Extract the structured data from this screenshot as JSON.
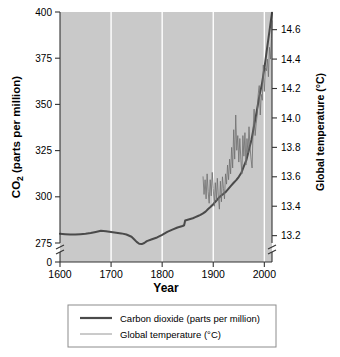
{
  "chart_data": {
    "type": "line",
    "title": "",
    "xlabel": "Year",
    "ylabel": "CO2 (parts per million)",
    "ylabel_right": "Global temperature (°C)",
    "xlim": [
      1600,
      2015
    ],
    "ylim": [
      275,
      400
    ],
    "ylim_right": [
      13.15,
      14.72
    ],
    "xticks": [
      1600,
      1700,
      1800,
      1900,
      2000
    ],
    "xticklabels": [
      "1600",
      "1700",
      "1800",
      "1900",
      "2000"
    ],
    "yticks": [
      275,
      300,
      325,
      350,
      375,
      400
    ],
    "yticklabels": [
      "275",
      "300",
      "325",
      "350",
      "375",
      "400"
    ],
    "y_broken_tick": "0",
    "yticks_right": [
      13.2,
      13.4,
      13.6,
      13.8,
      14.0,
      14.2,
      14.4,
      14.6
    ],
    "yticklabels_right": [
      "13.2",
      "13.4",
      "13.6",
      "13.8",
      "14.0",
      "14.2",
      "14.4",
      "14.6"
    ],
    "grid": "vertical-white",
    "axis_break_left": true,
    "axis_break_right": true,
    "legend_position": "below",
    "plot_background": "#c9c9c9",
    "series": [
      {
        "name": "Carbon dioxide (parts per million)",
        "axis": "left",
        "color": "#4a4a4a",
        "width": 2.0,
        "points": [
          [
            1600,
            280.0
          ],
          [
            1610,
            279.8
          ],
          [
            1620,
            279.6
          ],
          [
            1630,
            279.6
          ],
          [
            1640,
            279.8
          ],
          [
            1650,
            280.0
          ],
          [
            1660,
            280.4
          ],
          [
            1670,
            281.0
          ],
          [
            1680,
            281.6
          ],
          [
            1690,
            281.4
          ],
          [
            1700,
            281.0
          ],
          [
            1710,
            280.6
          ],
          [
            1720,
            280.2
          ],
          [
            1730,
            279.6
          ],
          [
            1740,
            278.4
          ],
          [
            1745,
            277.0
          ],
          [
            1750,
            275.6
          ],
          [
            1755,
            274.6
          ],
          [
            1760,
            274.4
          ],
          [
            1765,
            275.0
          ],
          [
            1770,
            276.0
          ],
          [
            1780,
            277.0
          ],
          [
            1790,
            278.0
          ],
          [
            1800,
            279.4
          ],
          [
            1810,
            281.0
          ],
          [
            1820,
            282.2
          ],
          [
            1830,
            283.4
          ],
          [
            1840,
            284.2
          ],
          [
            1843,
            284.6
          ],
          [
            1845,
            287.2
          ],
          [
            1850,
            287.6
          ],
          [
            1855,
            288.0
          ],
          [
            1860,
            288.4
          ],
          [
            1865,
            289.0
          ],
          [
            1870,
            289.6
          ],
          [
            1875,
            290.2
          ],
          [
            1880,
            291.0
          ],
          [
            1885,
            292.0
          ],
          [
            1890,
            293.4
          ],
          [
            1895,
            294.6
          ],
          [
            1900,
            296.0
          ],
          [
            1905,
            297.6
          ],
          [
            1910,
            299.2
          ],
          [
            1915,
            300.6
          ],
          [
            1920,
            301.6
          ],
          [
            1925,
            302.8
          ],
          [
            1930,
            304.4
          ],
          [
            1935,
            306.0
          ],
          [
            1940,
            307.6
          ],
          [
            1945,
            309.0
          ],
          [
            1950,
            310.8
          ],
          [
            1955,
            313.0
          ],
          [
            1960,
            316.6
          ],
          [
            1965,
            320.0
          ],
          [
            1970,
            325.6
          ],
          [
            1975,
            331.0
          ],
          [
            1980,
            338.6
          ],
          [
            1985,
            346.0
          ],
          [
            1990,
            354.2
          ],
          [
            1995,
            360.6
          ],
          [
            2000,
            369.4
          ],
          [
            2005,
            379.6
          ],
          [
            2010,
            389.6
          ],
          [
            2015,
            399.6
          ]
        ]
      },
      {
        "name": "Global temperature (°C)",
        "axis": "right",
        "color": "#6e6e6e",
        "width": 0.8,
        "points": [
          [
            1880,
            13.6
          ],
          [
            1882,
            13.48
          ],
          [
            1884,
            13.58
          ],
          [
            1886,
            13.45
          ],
          [
            1888,
            13.62
          ],
          [
            1890,
            13.5
          ],
          [
            1892,
            13.42
          ],
          [
            1894,
            13.58
          ],
          [
            1896,
            13.47
          ],
          [
            1898,
            13.63
          ],
          [
            1900,
            13.52
          ],
          [
            1902,
            13.4
          ],
          [
            1904,
            13.56
          ],
          [
            1906,
            13.44
          ],
          [
            1908,
            13.59
          ],
          [
            1910,
            13.46
          ],
          [
            1912,
            13.38
          ],
          [
            1914,
            13.57
          ],
          [
            1916,
            13.43
          ],
          [
            1918,
            13.6
          ],
          [
            1920,
            13.52
          ],
          [
            1922,
            13.45
          ],
          [
            1924,
            13.62
          ],
          [
            1926,
            13.55
          ],
          [
            1928,
            13.68
          ],
          [
            1930,
            13.58
          ],
          [
            1932,
            13.72
          ],
          [
            1934,
            13.62
          ],
          [
            1936,
            13.8
          ],
          [
            1938,
            13.66
          ],
          [
            1940,
            13.92
          ],
          [
            1942,
            13.72
          ],
          [
            1944,
            14.02
          ],
          [
            1946,
            13.78
          ],
          [
            1948,
            13.88
          ],
          [
            1950,
            13.7
          ],
          [
            1952,
            13.86
          ],
          [
            1954,
            13.72
          ],
          [
            1956,
            13.62
          ],
          [
            1958,
            13.88
          ],
          [
            1960,
            13.74
          ],
          [
            1962,
            13.9
          ],
          [
            1964,
            13.68
          ],
          [
            1966,
            13.86
          ],
          [
            1968,
            13.76
          ],
          [
            1970,
            13.94
          ],
          [
            1972,
            13.8
          ],
          [
            1974,
            13.72
          ],
          [
            1976,
            13.66
          ],
          [
            1978,
            13.92
          ],
          [
            1980,
            14.06
          ],
          [
            1982,
            13.88
          ],
          [
            1984,
            13.96
          ],
          [
            1986,
            14.02
          ],
          [
            1988,
            14.16
          ],
          [
            1990,
            14.22
          ],
          [
            1992,
            14.02
          ],
          [
            1994,
            14.16
          ],
          [
            1996,
            14.12
          ],
          [
            1998,
            14.36
          ],
          [
            2000,
            14.18
          ],
          [
            2002,
            14.34
          ],
          [
            2004,
            14.32
          ],
          [
            2006,
            14.4
          ],
          [
            2008,
            14.28
          ],
          [
            2010,
            14.48
          ],
          [
            2012,
            14.4
          ],
          [
            2014,
            14.54
          ],
          [
            2015,
            14.66
          ]
        ]
      }
    ]
  },
  "legend": {
    "entries": [
      {
        "label": "Carbon dioxide (parts per million)",
        "swatch": "thick-dark-line"
      },
      {
        "label": "Global temperature (°C)",
        "swatch": "thin-gray-line"
      }
    ]
  },
  "colors": {
    "plot_bg": "#c9c9c9",
    "gridline": "#ffffff",
    "co2_line": "#4a4a4a",
    "temp_line": "#6e6e6e",
    "axis": "#333333",
    "text": "#000000",
    "legend_border": "#8c8c8c"
  }
}
